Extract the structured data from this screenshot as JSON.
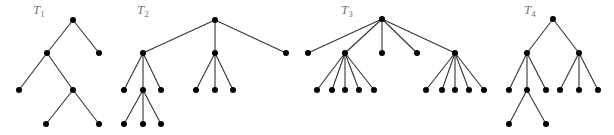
{
  "diagram": {
    "title": "",
    "colors": {
      "edge": "#333333",
      "node": "#000000",
      "label": "#777777"
    },
    "trees": [
      {
        "label": "T",
        "subscript": "1",
        "label_pos": [
          33,
          14
        ],
        "nodes": [
          [
            73,
            20
          ],
          [
            47,
            53
          ],
          [
            99,
            53
          ],
          [
            19,
            90
          ],
          [
            73,
            90
          ],
          [
            46,
            124
          ],
          [
            99,
            124
          ]
        ],
        "edges": [
          [
            0,
            1
          ],
          [
            0,
            2
          ],
          [
            1,
            3
          ],
          [
            1,
            4
          ],
          [
            4,
            5
          ],
          [
            4,
            6
          ]
        ]
      },
      {
        "label": "T",
        "subscript": "2",
        "label_pos": [
          137,
          14
        ],
        "nodes": [
          [
            215,
            20
          ],
          [
            143,
            53
          ],
          [
            215,
            53
          ],
          [
            286,
            53
          ],
          [
            124,
            90
          ],
          [
            143,
            90
          ],
          [
            161,
            90
          ],
          [
            196,
            90
          ],
          [
            215,
            90
          ],
          [
            233,
            90
          ],
          [
            124,
            124
          ],
          [
            143,
            124
          ],
          [
            161,
            124
          ]
        ],
        "edges": [
          [
            0,
            1
          ],
          [
            0,
            2
          ],
          [
            0,
            3
          ],
          [
            1,
            4
          ],
          [
            1,
            5
          ],
          [
            1,
            6
          ],
          [
            2,
            7
          ],
          [
            2,
            8
          ],
          [
            2,
            9
          ],
          [
            5,
            10
          ],
          [
            5,
            11
          ],
          [
            5,
            12
          ]
        ]
      },
      {
        "label": "T",
        "subscript": "3",
        "label_pos": [
          341,
          14
        ],
        "nodes": [
          [
            382,
            19
          ],
          [
            308,
            53
          ],
          [
            345,
            53
          ],
          [
            382,
            53
          ],
          [
            417,
            53
          ],
          [
            455,
            53
          ],
          [
            317,
            90
          ],
          [
            332,
            90
          ],
          [
            345,
            90
          ],
          [
            359,
            90
          ],
          [
            374,
            90
          ],
          [
            426,
            90
          ],
          [
            442,
            90
          ],
          [
            455,
            90
          ],
          [
            469,
            90
          ],
          [
            484,
            90
          ]
        ],
        "edges": [
          [
            0,
            1
          ],
          [
            0,
            2
          ],
          [
            0,
            3
          ],
          [
            0,
            4
          ],
          [
            0,
            5
          ],
          [
            2,
            6
          ],
          [
            2,
            7
          ],
          [
            2,
            8
          ],
          [
            2,
            9
          ],
          [
            2,
            10
          ],
          [
            5,
            11
          ],
          [
            5,
            12
          ],
          [
            5,
            13
          ],
          [
            5,
            14
          ],
          [
            5,
            15
          ]
        ]
      },
      {
        "label": "T",
        "subscript": "4",
        "label_pos": [
          524,
          14
        ],
        "nodes": [
          [
            553,
            19
          ],
          [
            527,
            53
          ],
          [
            579,
            53
          ],
          [
            509,
            90
          ],
          [
            527,
            90
          ],
          [
            546,
            90
          ],
          [
            560,
            90
          ],
          [
            579,
            90
          ],
          [
            598,
            90
          ],
          [
            509,
            124
          ],
          [
            546,
            124
          ]
        ],
        "edges": [
          [
            0,
            1
          ],
          [
            0,
            2
          ],
          [
            1,
            3
          ],
          [
            1,
            4
          ],
          [
            1,
            5
          ],
          [
            2,
            6
          ],
          [
            2,
            7
          ],
          [
            2,
            8
          ],
          [
            4,
            9
          ],
          [
            4,
            10
          ]
        ]
      }
    ]
  }
}
